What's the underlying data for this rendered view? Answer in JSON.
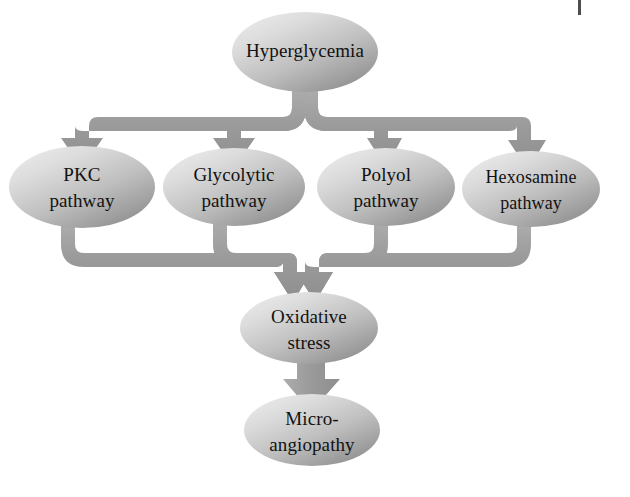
{
  "diagram": {
    "colors": {
      "connector": "#9a9a9a",
      "connector_edge": "#8a8a8a",
      "node_light": "#e9e9e9",
      "node_mid": "#bdbdbd",
      "node_dark": "#8f8f8f",
      "text": "#121212",
      "background": "#ffffff"
    },
    "nodes": [
      {
        "id": "hyperglycemia",
        "lines": [
          "Hyperglycemia"
        ],
        "cx": 305,
        "cy": 52,
        "rx": 73,
        "ry": 40
      },
      {
        "id": "pkc",
        "lines": [
          "PKC",
          "pathway"
        ],
        "cx": 82,
        "cy": 187,
        "rx": 73,
        "ry": 41
      },
      {
        "id": "glycolytic",
        "lines": [
          "Glycolytic",
          "pathway"
        ],
        "cx": 234,
        "cy": 187,
        "rx": 71,
        "ry": 39
      },
      {
        "id": "polyol",
        "lines": [
          "Polyol",
          "pathway"
        ],
        "cx": 386,
        "cy": 187,
        "rx": 69,
        "ry": 39
      },
      {
        "id": "hexosamine",
        "lines": [
          "Hexosamine",
          "pathway"
        ],
        "cx": 531,
        "cy": 189,
        "rx": 69,
        "ry": 38
      },
      {
        "id": "oxidative-stress",
        "lines": [
          "Oxidative",
          "stress"
        ],
        "cx": 309,
        "cy": 328,
        "rx": 69,
        "ry": 36
      },
      {
        "id": "micro-angiopathy",
        "lines": [
          "Micro-",
          "angiopathy"
        ],
        "cx": 312,
        "cy": 430,
        "rx": 68,
        "ry": 36
      }
    ],
    "edges": [
      {
        "id": "hyperglycemia-to-pkc",
        "from": "hyperglycemia",
        "to": "pkc"
      },
      {
        "id": "hyperglycemia-to-glycolytic",
        "from": "hyperglycemia",
        "to": "glycolytic"
      },
      {
        "id": "hyperglycemia-to-polyol",
        "from": "hyperglycemia",
        "to": "polyol"
      },
      {
        "id": "hyperglycemia-to-hexosamine",
        "from": "hyperglycemia",
        "to": "hexosamine"
      },
      {
        "id": "pkc-to-oxidative-stress",
        "from": "pkc",
        "to": "oxidative-stress"
      },
      {
        "id": "glycolytic-to-oxidative-stress",
        "from": "glycolytic",
        "to": "oxidative-stress"
      },
      {
        "id": "polyol-to-oxidative-stress",
        "from": "polyol",
        "to": "oxidative-stress"
      },
      {
        "id": "hexosamine-to-oxidative-stress",
        "from": "hexosamine",
        "to": "oxidative-stress"
      },
      {
        "id": "oxidative-stress-to-micro-angiopathy",
        "from": "oxidative-stress",
        "to": "micro-angiopathy"
      }
    ],
    "page_mark": "page-edge-artifact"
  }
}
